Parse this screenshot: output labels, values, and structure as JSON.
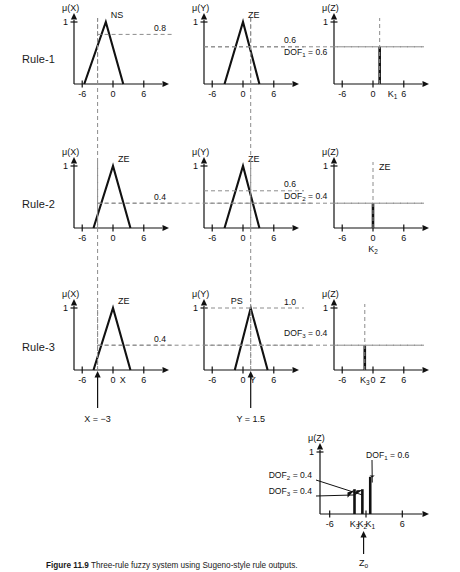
{
  "figure": {
    "caption_label": "Figure 11.9",
    "caption_text": "Three-rule fuzzy system using Sugeno-style rule outputs."
  },
  "rules": [
    {
      "name": "Rule-1",
      "charts": [
        {
          "axis_label": "mu(X)",
          "set_label": "NS",
          "ticks": [
            "-6",
            "0",
            "6"
          ],
          "y_tick": "1",
          "level_label": "0.8",
          "level": 0.8,
          "triangle": [
            -5.6,
            -1.4,
            2.0
          ],
          "input_line_x": -3,
          "has_input_arrow": false
        },
        {
          "axis_label": "mu(Y)",
          "set_label": "ZE",
          "ticks": [
            "-6",
            "0",
            "6"
          ],
          "y_tick": "1",
          "level_label": "0.6",
          "dof_label": "DOF1 = 0.6",
          "level": 0.6,
          "triangle": [
            -3.6,
            0,
            3.2
          ],
          "input_line_x": 1.5,
          "has_input_arrow": false
        },
        {
          "axis_label": "mu(Z)",
          "ticks": [
            "-6",
            "0",
            "6"
          ],
          "y_tick": "1",
          "spike_label": "K1",
          "spike_x": 1.3,
          "spike_height": 0.6
        }
      ]
    },
    {
      "name": "Rule-2",
      "charts": [
        {
          "axis_label": "mu(X)",
          "set_label": "ZE",
          "ticks": [
            "-6",
            "0",
            "6"
          ],
          "y_tick": "1",
          "level_label": "0.4",
          "level": 0.4,
          "triangle": [
            -3.8,
            0,
            3.4
          ],
          "input_line_x": -3,
          "has_input_arrow": false
        },
        {
          "axis_label": "mu(Y)",
          "set_label": "ZE",
          "ticks": [
            "-6",
            "0",
            "6"
          ],
          "y_tick": "1",
          "level_label": "0.6",
          "dof_label": "DOF2 = 0.4",
          "level": 0.6,
          "triangle": [
            -3.6,
            0,
            3.2
          ],
          "input_line_x": 1.5,
          "has_input_arrow": false
        },
        {
          "axis_label": "mu(Z)",
          "set_label": "ZE",
          "ticks": [
            "-6",
            "0",
            "6"
          ],
          "y_tick": "1",
          "spike_label": "K2",
          "spike_x": 0,
          "spike_height": 0.4
        }
      ]
    },
    {
      "name": "Rule-3",
      "charts": [
        {
          "axis_label": "mu(X)",
          "set_label": "ZE",
          "ticks": [
            "-6",
            "0",
            "6"
          ],
          "axis_var": "X",
          "y_tick": "1",
          "level_label": "0.4",
          "level": 0.4,
          "triangle": [
            -3.8,
            0,
            3.4
          ],
          "input_line_x": -3,
          "has_input_arrow": true,
          "input_caption": "X = −3"
        },
        {
          "axis_label": "mu(Y)",
          "set_label": "PS",
          "ticks": [
            "-6",
            "0",
            "6"
          ],
          "axis_var": "Y",
          "y_tick": "1",
          "level_label": "1.0",
          "dof_label": "DOF3 = 0.4",
          "level": 1.0,
          "triangle": [
            -1.6,
            1.5,
            4.8
          ],
          "input_line_x": 1.5,
          "has_input_arrow": true,
          "input_caption": "Y = 1.5"
        },
        {
          "axis_label": "mu(Z)",
          "ticks": [
            "-6",
            "0",
            "6"
          ],
          "axis_var": "Z",
          "y_tick": "1",
          "spike_label": "K3",
          "spike_x": -1.6,
          "spike_height": 0.4
        }
      ]
    }
  ],
  "aggregate": {
    "axis_label": "mu(Z)",
    "y_tick": "1",
    "ticks": [
      "-6",
      "6"
    ],
    "spikes": [
      {
        "label": "K3",
        "x": -1.9,
        "height": 0.4,
        "annotation": "DOF3 = 0.4"
      },
      {
        "label": "K2",
        "x": -0.6,
        "height": 0.4,
        "annotation": "DOF2 = 0.4"
      },
      {
        "label": "K1",
        "x": 0.7,
        "height": 0.6,
        "annotation": "DOF1 = 0.6"
      }
    ],
    "output_label": "Z0",
    "output_x": -0.4
  },
  "chart_data": {
    "type": "line",
    "title": "Three-rule fuzzy system using Sugeno-style rule outputs.",
    "xlabel": "X / Y / Z",
    "ylabel": "membership μ",
    "xlim": [
      -7.5,
      7.5
    ],
    "ylim": [
      0,
      1.1
    ],
    "grid": false,
    "legend": "none",
    "inputs": {
      "X": -3,
      "Y": 1.5
    },
    "rules": [
      {
        "name": "Rule-1",
        "antecedent_X": {
          "set": "NS",
          "triangle": [
            -5.6,
            -1.4,
            2.0
          ],
          "membership_at_input": 0.8
        },
        "antecedent_Y": {
          "set": "ZE",
          "triangle": [
            -3.6,
            0.0,
            3.2
          ],
          "membership_at_input": 0.6
        },
        "dof": 0.6,
        "consequent": {
          "singleton": "K1",
          "position": 1.3,
          "height": 0.6
        }
      },
      {
        "name": "Rule-2",
        "antecedent_X": {
          "set": "ZE",
          "triangle": [
            -3.8,
            0.0,
            3.4
          ],
          "membership_at_input": 0.4
        },
        "antecedent_Y": {
          "set": "ZE",
          "triangle": [
            -3.6,
            0.0,
            3.2
          ],
          "membership_at_input": 0.6
        },
        "dof": 0.4,
        "consequent": {
          "singleton": "K2",
          "position": 0.0,
          "height": 0.4
        }
      },
      {
        "name": "Rule-3",
        "antecedent_X": {
          "set": "ZE",
          "triangle": [
            -3.8,
            0.0,
            3.4
          ],
          "membership_at_input": 0.4
        },
        "antecedent_Y": {
          "set": "PS",
          "triangle": [
            -1.6,
            1.5,
            4.8
          ],
          "membership_at_input": 1.0
        },
        "dof": 0.4,
        "consequent": {
          "singleton": "K3",
          "position": -1.6,
          "height": 0.4
        }
      }
    ],
    "aggregate": {
      "singletons": [
        {
          "label": "K3",
          "position": -1.9,
          "height": 0.4
        },
        {
          "label": "K2",
          "position": -0.6,
          "height": 0.4
        },
        {
          "label": "K1",
          "position": 0.7,
          "height": 0.6
        }
      ],
      "defuzzified_output": {
        "label": "Z0",
        "position": -0.4
      }
    }
  }
}
